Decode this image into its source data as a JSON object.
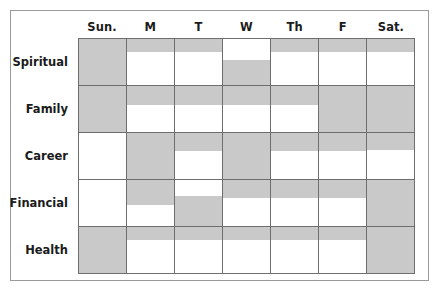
{
  "chart_data": {
    "type": "heatmap",
    "title": "",
    "subtitle": "",
    "xlabel": "",
    "ylabel": "",
    "legend": [],
    "grid": true,
    "fill_color": "#c9c9c9",
    "empty_color": "#ffffff",
    "line_color": "#6e6e6e",
    "value_scale": [
      0,
      100
    ],
    "value_unit": "percent fill of cell",
    "categories": [
      "Sun.",
      "M",
      "T",
      "W",
      "Th",
      "F",
      "Sat."
    ],
    "rows": [
      "Spiritual",
      "Family",
      "Career",
      "Financial",
      "Health"
    ],
    "series": [
      {
        "name": "Spiritual",
        "values": [
          100,
          28,
          28,
          55,
          28,
          28,
          28
        ],
        "anchors": [
          "top",
          "top",
          "top",
          "bottom",
          "top",
          "top",
          "top"
        ]
      },
      {
        "name": "Family",
        "values": [
          100,
          42,
          42,
          42,
          42,
          100,
          100
        ],
        "anchors": [
          "top",
          "top",
          "top",
          "top",
          "top",
          "top",
          "top"
        ]
      },
      {
        "name": "Career",
        "values": [
          0,
          100,
          40,
          100,
          40,
          40,
          38
        ],
        "anchors": [
          "top",
          "top",
          "top",
          "top",
          "top",
          "top",
          "top"
        ]
      },
      {
        "name": "Financial",
        "values": [
          0,
          55,
          65,
          40,
          40,
          40,
          100
        ],
        "anchors": [
          "top",
          "top",
          "bottom",
          "top",
          "top",
          "top",
          "top"
        ]
      },
      {
        "name": "Health",
        "values": [
          100,
          28,
          28,
          28,
          28,
          28,
          100
        ],
        "anchors": [
          "top",
          "top",
          "top",
          "top",
          "top",
          "top",
          "top"
        ]
      }
    ]
  }
}
